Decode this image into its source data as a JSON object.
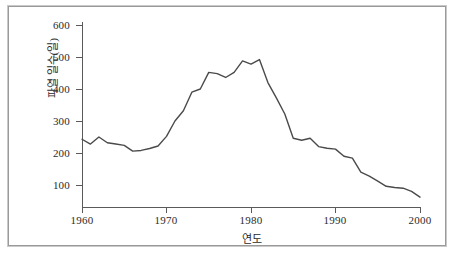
{
  "chart_data": {
    "type": "line",
    "title": "",
    "xlabel": "연도",
    "ylabel": "파열 일수(일)",
    "xlim": [
      1960,
      2000
    ],
    "ylim": [
      0,
      640
    ],
    "grid": false,
    "legend": null,
    "line_color": "#4a4a4a",
    "x_ticks": [
      "1960",
      "1970",
      "1980",
      "1990",
      "2000"
    ],
    "x_tick_values": [
      1960,
      1970,
      1980,
      1990,
      2000
    ],
    "y_ticks": [
      "100",
      "200",
      "300",
      "400",
      "500",
      "600"
    ],
    "y_tick_values": [
      100,
      200,
      300,
      400,
      500,
      600
    ],
    "series": [
      {
        "name": "파열 일수(일)",
        "x": [
          1960,
          1961,
          1962,
          1963,
          1964,
          1965,
          1966,
          1967,
          1968,
          1969,
          1970,
          1971,
          1972,
          1973,
          1974,
          1975,
          1976,
          1977,
          1978,
          1979,
          1980,
          1981,
          1982,
          1983,
          1984,
          1985,
          1986,
          1987,
          1988,
          1989,
          1990,
          1991,
          1992,
          1993,
          1994,
          1995,
          1996,
          1997,
          1998,
          1999,
          2000
        ],
        "values": [
          243,
          228,
          250,
          232,
          228,
          224,
          206,
          208,
          214,
          222,
          252,
          300,
          332,
          390,
          400,
          452,
          448,
          436,
          452,
          488,
          478,
          492,
          420,
          372,
          322,
          246,
          240,
          246,
          220,
          215,
          212,
          190,
          184,
          140,
          128,
          112,
          96,
          92,
          90,
          80,
          62
        ]
      }
    ]
  }
}
